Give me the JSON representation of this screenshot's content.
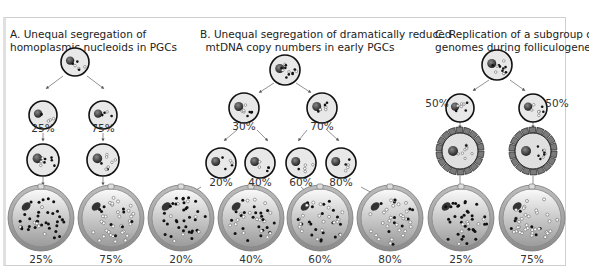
{
  "panels": [
    {
      "id": "A",
      "title_line1": "A. Unequal segregation of",
      "title_line2": "homoplasmic nucleoids in PGCs",
      "mid_labels": [
        "25%",
        "75%"
      ],
      "bottom_labels": [
        "25%",
        "75%"
      ]
    },
    {
      "id": "B",
      "title_line1": "B. Unequal segregation of dramatically reduced",
      "title_line2": "mtDNA copy numbers in early PGCs",
      "mid_labels": [
        "30%",
        "70%"
      ],
      "lower_labels": [
        "20%",
        "40%",
        "60%",
        "80%"
      ],
      "bottom_labels": [
        "20%",
        "40%",
        "60%",
        "80%"
      ]
    },
    {
      "id": "C",
      "title_line1": "C. Replication of a subgroup of",
      "title_line2": "genomes during folliculogenesis",
      "mid_labels": [
        "50%",
        "50%"
      ],
      "bottom_labels": [
        "25%",
        "75%"
      ]
    }
  ],
  "colors": {
    "cell_fill": "#e8e8e8",
    "cell_stroke": "#111111",
    "nucleus": "#333333",
    "oocyte_rim": "#9a9a9a",
    "granulosa": "#777777",
    "mutant": "#111111",
    "wildtype": "#ffffff"
  }
}
